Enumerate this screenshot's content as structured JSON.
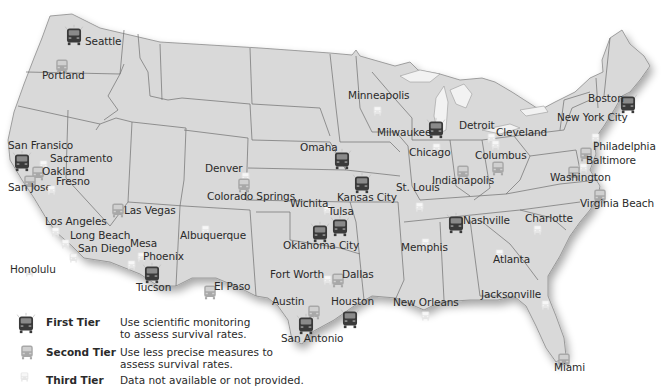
{
  "map": {
    "land_color": "#d9d9d9",
    "border_color": "#6e6e6e",
    "background": "#ffffff"
  },
  "tiers": {
    "first": {
      "color": "#3a3a3a",
      "label": "First Tier",
      "description": "Use scientific monitoring to assess survival rates.",
      "icon": "bus-icon-dark"
    },
    "second": {
      "color": "#a8a8a8",
      "label": "Second Tier",
      "description": "Use less precise measures to assess survival rates.",
      "icon": "bus-icon-medium"
    },
    "third": {
      "color": "#e6e6e6",
      "label": "Third Tier",
      "description": "Data not available or not provided.",
      "icon": "bus-icon-light"
    }
  },
  "cities": [
    {
      "name": "Seattle",
      "tier": "first",
      "icon_x": 64,
      "icon_y": 24,
      "label_x": 85,
      "label_y": 36
    },
    {
      "name": "Portland",
      "tier": "second",
      "icon_x": 54,
      "icon_y": 56,
      "label_x": 42,
      "label_y": 70
    },
    {
      "name": "San Fransico",
      "tier": "first",
      "icon_x": 12,
      "icon_y": 150,
      "label_x": 8,
      "label_y": 140
    },
    {
      "name": "Sacramento",
      "tier": "third",
      "icon_x": 38,
      "icon_y": 155,
      "label_x": 50,
      "label_y": 153
    },
    {
      "name": "Oakland",
      "tier": "second",
      "icon_x": 30,
      "icon_y": 163,
      "label_x": 42,
      "label_y": 166
    },
    {
      "name": "San Jose",
      "tier": "second",
      "icon_x": 22,
      "icon_y": 172,
      "label_x": 8,
      "label_y": 182
    },
    {
      "name": "Fresno",
      "tier": "third",
      "icon_x": 46,
      "icon_y": 180,
      "label_x": 56,
      "label_y": 176
    },
    {
      "name": "Las Vegas",
      "tier": "second",
      "icon_x": 110,
      "icon_y": 200,
      "label_x": 124,
      "label_y": 205
    },
    {
      "name": "Los Angeles",
      "tier": "third",
      "icon_x": 50,
      "icon_y": 222,
      "label_x": 45,
      "label_y": 216
    },
    {
      "name": "Long Beach",
      "tier": "third",
      "icon_x": 60,
      "icon_y": 234,
      "label_x": 70,
      "label_y": 230
    },
    {
      "name": "San Diego",
      "tier": "third",
      "icon_x": 68,
      "icon_y": 248,
      "label_x": 78,
      "label_y": 243
    },
    {
      "name": "Mesa",
      "tier": "third",
      "icon_x": 136,
      "icon_y": 247,
      "label_x": 130,
      "label_y": 238
    },
    {
      "name": "Phoenix",
      "tier": "third",
      "icon_x": 126,
      "icon_y": 255,
      "label_x": 143,
      "label_y": 251
    },
    {
      "name": "Tucson",
      "tier": "first",
      "icon_x": 142,
      "icon_y": 262,
      "label_x": 136,
      "label_y": 282
    },
    {
      "name": "Honolulu",
      "tier": "third",
      "icon_x": 24,
      "icon_y": 262,
      "label_x": 10,
      "label_y": 264
    },
    {
      "name": "Albuquerque",
      "tier": "third",
      "icon_x": 200,
      "icon_y": 220,
      "label_x": 180,
      "label_y": 230
    },
    {
      "name": "El Paso",
      "tier": "second",
      "icon_x": 202,
      "icon_y": 282,
      "label_x": 214,
      "label_y": 281
    },
    {
      "name": "Denver",
      "tier": "third",
      "icon_x": 240,
      "icon_y": 167,
      "label_x": 205,
      "label_y": 163
    },
    {
      "name": "Colorado Springs",
      "tier": "second",
      "icon_x": 236,
      "icon_y": 175,
      "label_x": 207,
      "label_y": 191
    },
    {
      "name": "Wichita",
      "tier": "third",
      "icon_x": 322,
      "icon_y": 200,
      "label_x": 290,
      "label_y": 198
    },
    {
      "name": "Omaha",
      "tier": "first",
      "icon_x": 332,
      "icon_y": 148,
      "label_x": 300,
      "label_y": 142
    },
    {
      "name": "Kansas City",
      "tier": "first",
      "icon_x": 352,
      "icon_y": 172,
      "label_x": 337,
      "label_y": 192
    },
    {
      "name": "Tulsa",
      "tier": "first",
      "icon_x": 330,
      "icon_y": 215,
      "label_x": 328,
      "label_y": 206
    },
    {
      "name": "Oklahoma City",
      "tier": "first",
      "icon_x": 310,
      "icon_y": 221,
      "label_x": 283,
      "label_y": 240
    },
    {
      "name": "Fort Worth",
      "tier": "third",
      "icon_x": 322,
      "icon_y": 270,
      "label_x": 270,
      "label_y": 269
    },
    {
      "name": "Dallas",
      "tier": "second",
      "icon_x": 330,
      "icon_y": 270,
      "label_x": 342,
      "label_y": 269
    },
    {
      "name": "Austin",
      "tier": "second",
      "icon_x": 306,
      "icon_y": 302,
      "label_x": 272,
      "label_y": 296
    },
    {
      "name": "San Antonio",
      "tier": "first",
      "icon_x": 296,
      "icon_y": 313,
      "label_x": 281,
      "label_y": 333
    },
    {
      "name": "Houston",
      "tier": "first",
      "icon_x": 340,
      "icon_y": 307,
      "label_x": 331,
      "label_y": 296
    },
    {
      "name": "Minneapolis",
      "tier": "third",
      "icon_x": 372,
      "icon_y": 101,
      "label_x": 348,
      "label_y": 90
    },
    {
      "name": "Milwaukee",
      "tier": "first",
      "icon_x": 426,
      "icon_y": 117,
      "label_x": 377,
      "label_y": 127
    },
    {
      "name": "Chicago",
      "tier": "third",
      "icon_x": 431,
      "icon_y": 138,
      "label_x": 409,
      "label_y": 147
    },
    {
      "name": "Detroit",
      "tier": "third",
      "icon_x": 486,
      "icon_y": 128,
      "label_x": 459,
      "label_y": 120
    },
    {
      "name": "Cleveland",
      "tier": "third",
      "icon_x": 490,
      "icon_y": 135,
      "label_x": 496,
      "label_y": 127
    },
    {
      "name": "Columbus",
      "tier": "second",
      "icon_x": 490,
      "icon_y": 158,
      "label_x": 475,
      "label_y": 150
    },
    {
      "name": "Indianapolis",
      "tier": "second",
      "icon_x": 455,
      "icon_y": 162,
      "label_x": 432,
      "label_y": 175
    },
    {
      "name": "St. Louis",
      "tier": "third",
      "icon_x": 414,
      "icon_y": 197,
      "label_x": 396,
      "label_y": 182
    },
    {
      "name": "Nashville",
      "tier": "first",
      "icon_x": 446,
      "icon_y": 212,
      "label_x": 463,
      "label_y": 215
    },
    {
      "name": "Memphis",
      "tier": "third",
      "icon_x": 420,
      "icon_y": 233,
      "label_x": 401,
      "label_y": 242
    },
    {
      "name": "Charlotte",
      "tier": "third",
      "icon_x": 532,
      "icon_y": 220,
      "label_x": 525,
      "label_y": 213
    },
    {
      "name": "Atlanta",
      "tier": "third",
      "icon_x": 494,
      "icon_y": 244,
      "label_x": 493,
      "label_y": 254
    },
    {
      "name": "New Orleans",
      "tier": "third",
      "icon_x": 420,
      "icon_y": 306,
      "label_x": 393,
      "label_y": 297
    },
    {
      "name": "Jacksonville",
      "tier": "third",
      "icon_x": 540,
      "icon_y": 295,
      "label_x": 481,
      "label_y": 289
    },
    {
      "name": "Miami",
      "tier": "second",
      "icon_x": 556,
      "icon_y": 350,
      "label_x": 554,
      "label_y": 362
    },
    {
      "name": "Boston",
      "tier": "first",
      "icon_x": 618,
      "icon_y": 92,
      "label_x": 588,
      "label_y": 93
    },
    {
      "name": "New York City",
      "tier": "third",
      "icon_x": 590,
      "icon_y": 128,
      "label_x": 557,
      "label_y": 112
    },
    {
      "name": "Philadelphia",
      "tier": "second",
      "icon_x": 578,
      "icon_y": 144,
      "label_x": 593,
      "label_y": 141
    },
    {
      "name": "Baltimore",
      "tier": "third",
      "icon_x": 578,
      "icon_y": 158,
      "label_x": 586,
      "label_y": 155
    },
    {
      "name": "Washington",
      "tier": "second",
      "icon_x": 566,
      "icon_y": 163,
      "label_x": 550,
      "label_y": 172
    },
    {
      "name": "Virginia Beach",
      "tier": "second",
      "icon_x": 592,
      "icon_y": 186,
      "label_x": 580,
      "label_y": 198
    }
  ]
}
